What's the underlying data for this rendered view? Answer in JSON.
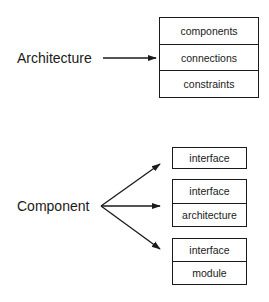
{
  "architecture": {
    "label": "Architecture",
    "parts": [
      "components",
      "connections",
      "constraints"
    ]
  },
  "component": {
    "label": "Component",
    "variants": [
      {
        "parts": [
          "interface"
        ]
      },
      {
        "parts": [
          "interface",
          "architecture"
        ]
      },
      {
        "parts": [
          "interface",
          "module"
        ]
      }
    ]
  }
}
